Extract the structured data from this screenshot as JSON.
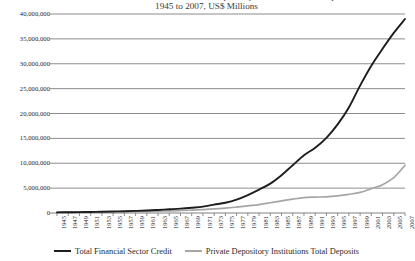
{
  "chart_data": {
    "type": "line",
    "title": "Total Financial Sector Credit and Private Depository Institutions Total Deposits",
    "subtitle": "1945 to 2007, US$ Millions",
    "xlabel": "",
    "ylabel": "",
    "ylim": [
      0,
      40000000
    ],
    "xlim": [
      1945,
      2007
    ],
    "grid": true,
    "legend_position": "bottom",
    "ytick_labels": [
      "40,000,000",
      "35,000,000",
      "30,000,000",
      "25,000,000",
      "20,000,000",
      "15,000,000",
      "10,000,000",
      "5,000,000",
      "0"
    ],
    "ytick_values": [
      40000000,
      35000000,
      30000000,
      25000000,
      20000000,
      15000000,
      10000000,
      5000000,
      0
    ],
    "categories": [
      "1945",
      "1947",
      "1949",
      "1951",
      "1953",
      "1955",
      "1957",
      "1959",
      "1961",
      "1963",
      "1965",
      "1967",
      "1969",
      "1971",
      "1973",
      "1975",
      "1977",
      "1979",
      "1981",
      "1983",
      "1985",
      "1987",
      "1989",
      "1991",
      "1993",
      "1995",
      "1997",
      "1999",
      "2001",
      "2003",
      "2005",
      "2007"
    ],
    "x": [
      1945,
      1947,
      1949,
      1951,
      1953,
      1955,
      1957,
      1959,
      1961,
      1963,
      1965,
      1967,
      1969,
      1971,
      1973,
      1975,
      1977,
      1979,
      1981,
      1983,
      1985,
      1987,
      1989,
      1991,
      1993,
      1995,
      1997,
      1999,
      2001,
      2003,
      2005,
      2007
    ],
    "series": [
      {
        "name": "Total Financial Sector Credit",
        "color": "#1d1d1d",
        "values": [
          120000,
          150000,
          175000,
          215000,
          255000,
          310000,
          360000,
          430000,
          500000,
          610000,
          740000,
          880000,
          1070000,
          1290000,
          1680000,
          2050000,
          2680000,
          3600000,
          4700000,
          5900000,
          7600000,
          9600000,
          11600000,
          13100000,
          15100000,
          17800000,
          21200000,
          25600000,
          29600000,
          33000000,
          36200000,
          39000000
        ]
      },
      {
        "name": "Private Depository Institutions Total Deposits",
        "color": "#a6a6a6",
        "values": [
          150000,
          160000,
          170000,
          190000,
          210000,
          230000,
          255000,
          280000,
          320000,
          370000,
          430000,
          500000,
          570000,
          680000,
          830000,
          970000,
          1190000,
          1440000,
          1700000,
          2060000,
          2450000,
          2800000,
          3100000,
          3200000,
          3250000,
          3450000,
          3750000,
          4150000,
          4900000,
          5700000,
          7100000,
          9600000
        ]
      }
    ]
  },
  "legend": {
    "entries": [
      {
        "label": "Total Financial Sector Credit",
        "swatch": "legend-line-black"
      },
      {
        "label": "Private Depository Institutions Total Deposits",
        "swatch": "legend-line-gray"
      }
    ]
  },
  "colors": {
    "series_credit": "#1d1d1d",
    "series_deposits": "#a6a6a6",
    "gridline": "#808080",
    "text": "#262626",
    "background": "#ffffff"
  }
}
